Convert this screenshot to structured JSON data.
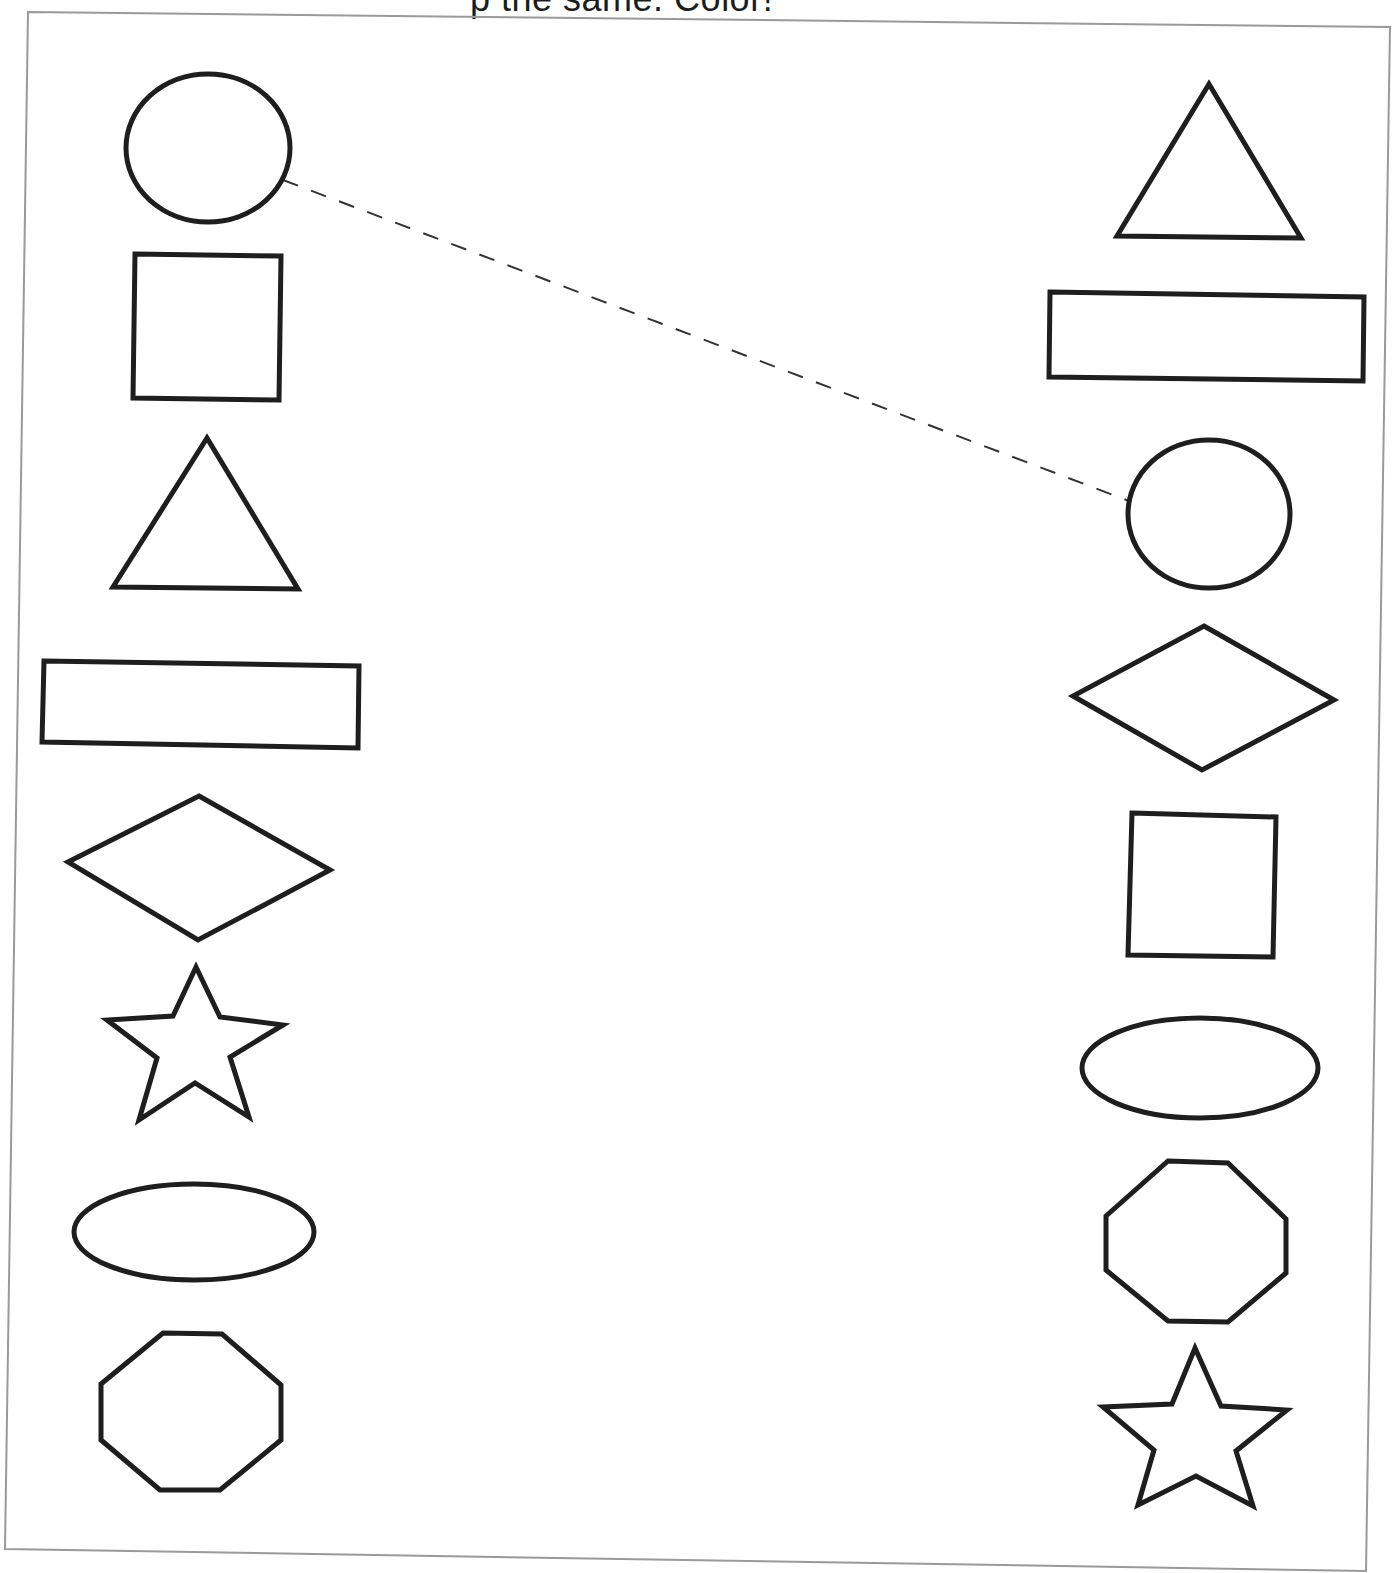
{
  "worksheet": {
    "instruction_partial": "p                   the same. Color!",
    "left_column_label": "Left shapes",
    "right_column_label": "Right shapes",
    "colors": {
      "shape_stroke": "#1e1e1e",
      "frame_stroke": "#9a9a9a",
      "background": "#ffffff"
    },
    "left_shapes": [
      "circle",
      "square",
      "triangle",
      "rectangle",
      "diamond",
      "star",
      "oval",
      "octagon"
    ],
    "right_shapes": [
      "triangle",
      "rectangle",
      "circle",
      "diamond",
      "square",
      "oval",
      "octagon",
      "star"
    ],
    "example_match": {
      "from": "circle (left)",
      "to": "circle (right)",
      "style": "dashed-line"
    }
  }
}
